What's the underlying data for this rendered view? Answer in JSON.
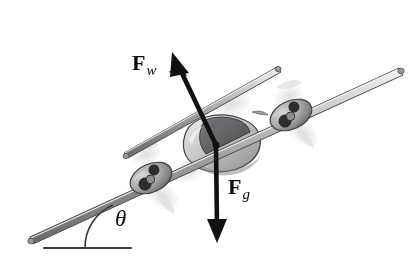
{
  "figure": {
    "background_color": "#ffffff",
    "ink_color": "#0d0d0d",
    "metal_light": "#e8e8e8",
    "metal_mid": "#b4b4b4",
    "metal_dark": "#6e6e6e",
    "canopy_dark": "#59595b",
    "blur_color": "#d8d8d8"
  },
  "labels": {
    "wing_force": {
      "symbol": "F",
      "subscript": "w",
      "name": "wing-force-label"
    },
    "gravity_force": {
      "symbol": "F",
      "subscript": "g",
      "name": "gravity-force-label"
    },
    "angle": {
      "symbol": "θ",
      "name": "incline-angle-label"
    }
  },
  "vectors": [
    {
      "name": "wing-force-arrow",
      "label": "F_w",
      "from": [
        216,
        145
      ],
      "to": [
        172,
        52
      ],
      "direction": "up-left",
      "description": "Wing (lift) force, perpendicular to the wings"
    },
    {
      "name": "gravity-force-arrow",
      "label": "F_g",
      "from": [
        216,
        145
      ],
      "to": [
        217,
        243
      ],
      "direction": "down",
      "description": "Gravitational force, vertically downward"
    }
  ],
  "geometry": {
    "horizontal_reference": {
      "from": [
        44,
        248
      ],
      "to": [
        131,
        248
      ]
    },
    "flight_path": {
      "from": [
        30,
        240
      ],
      "to": [
        400,
        70
      ]
    },
    "angle_arc": {
      "vertex": [
        131,
        248
      ],
      "radius": 46
    },
    "center_of_mass": [
      216,
      145
    ]
  },
  "aircraft": {
    "name": "twin-engine-airplane",
    "parts": [
      {
        "name": "fuselage",
        "description": "rounded grey body with dark canopy"
      },
      {
        "name": "front-wing",
        "description": "long tapered spar, lower-left to upper-right"
      },
      {
        "name": "rear-wing",
        "description": "shorter tapered spar above the fuselage"
      },
      {
        "name": "left-engine-nacelle",
        "description": "oval pod with propeller hub"
      },
      {
        "name": "right-engine-nacelle",
        "description": "oval pod with propeller hub"
      },
      {
        "name": "propeller-blur",
        "description": "light grey motion arcs"
      }
    ]
  }
}
